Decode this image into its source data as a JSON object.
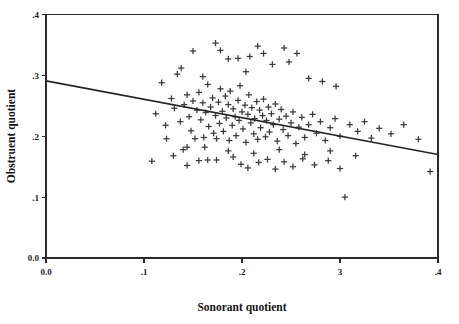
{
  "chart_data": {
    "type": "scatter",
    "title": "",
    "xlabel": "Sonorant quotient",
    "ylabel": "Obstruent quotient",
    "xlim": [
      0.0,
      0.4
    ],
    "ylim": [
      0.0,
      0.4
    ],
    "xticks": [
      0.0,
      0.1,
      0.2,
      0.3,
      0.4
    ],
    "yticks": [
      0.0,
      0.1,
      0.2,
      0.3,
      0.4
    ],
    "xticklabels": [
      "0.0",
      ".1",
      ".2",
      "3",
      ".4"
    ],
    "yticklabels": [
      "0.0",
      ".1",
      ".2",
      ".3",
      ".4"
    ],
    "grid": false,
    "legend": null,
    "marker": "plus",
    "marker_color": "#3a3a3a",
    "frame_color": "#2a2a2a",
    "series": [
      {
        "name": "observations",
        "points": [
          [
            0.108,
            0.159
          ],
          [
            0.112,
            0.237
          ],
          [
            0.118,
            0.288
          ],
          [
            0.123,
            0.196
          ],
          [
            0.128,
            0.262
          ],
          [
            0.131,
            0.246
          ],
          [
            0.134,
            0.302
          ],
          [
            0.137,
            0.224
          ],
          [
            0.14,
            0.178
          ],
          [
            0.141,
            0.252
          ],
          [
            0.144,
            0.268
          ],
          [
            0.146,
            0.232
          ],
          [
            0.148,
            0.209
          ],
          [
            0.15,
            0.258
          ],
          [
            0.152,
            0.196
          ],
          [
            0.154,
            0.243
          ],
          [
            0.156,
            0.272
          ],
          [
            0.158,
            0.227
          ],
          [
            0.16,
            0.255
          ],
          [
            0.161,
            0.198
          ],
          [
            0.163,
            0.239
          ],
          [
            0.165,
            0.285
          ],
          [
            0.166,
            0.216
          ],
          [
            0.168,
            0.248
          ],
          [
            0.17,
            0.263
          ],
          [
            0.171,
            0.205
          ],
          [
            0.173,
            0.234
          ],
          [
            0.174,
            0.196
          ],
          [
            0.176,
            0.256
          ],
          [
            0.177,
            0.221
          ],
          [
            0.178,
            0.278
          ],
          [
            0.18,
            0.241
          ],
          [
            0.181,
            0.208
          ],
          [
            0.183,
            0.266
          ],
          [
            0.184,
            0.23
          ],
          [
            0.186,
            0.252
          ],
          [
            0.187,
            0.193
          ],
          [
            0.188,
            0.274
          ],
          [
            0.19,
            0.218
          ],
          [
            0.191,
            0.245
          ],
          [
            0.193,
            0.232
          ],
          [
            0.194,
            0.201
          ],
          [
            0.196,
            0.259
          ],
          [
            0.197,
            0.226
          ],
          [
            0.198,
            0.283
          ],
          [
            0.2,
            0.24
          ],
          [
            0.201,
            0.212
          ],
          [
            0.203,
            0.251
          ],
          [
            0.204,
            0.19
          ],
          [
            0.206,
            0.236
          ],
          [
            0.207,
            0.268
          ],
          [
            0.209,
            0.222
          ],
          [
            0.21,
            0.247
          ],
          [
            0.212,
            0.204
          ],
          [
            0.213,
            0.229
          ],
          [
            0.215,
            0.257
          ],
          [
            0.216,
            0.195
          ],
          [
            0.218,
            0.243
          ],
          [
            0.219,
            0.214
          ],
          [
            0.221,
            0.234
          ],
          [
            0.222,
            0.261
          ],
          [
            0.224,
            0.199
          ],
          [
            0.225,
            0.226
          ],
          [
            0.227,
            0.248
          ],
          [
            0.228,
            0.207
          ],
          [
            0.23,
            0.237
          ],
          [
            0.232,
            0.219
          ],
          [
            0.234,
            0.253
          ],
          [
            0.236,
            0.192
          ],
          [
            0.238,
            0.228
          ],
          [
            0.24,
            0.244
          ],
          [
            0.242,
            0.211
          ],
          [
            0.245,
            0.233
          ],
          [
            0.247,
            0.201
          ],
          [
            0.25,
            0.222
          ],
          [
            0.252,
            0.24
          ],
          [
            0.255,
            0.188
          ],
          [
            0.258,
            0.215
          ],
          [
            0.261,
            0.231
          ],
          [
            0.264,
            0.198
          ],
          [
            0.268,
            0.219
          ],
          [
            0.272,
            0.236
          ],
          [
            0.276,
            0.205
          ],
          [
            0.28,
            0.224
          ],
          [
            0.285,
            0.193
          ],
          [
            0.29,
            0.214
          ],
          [
            0.295,
            0.229
          ],
          [
            0.3,
            0.2
          ],
          [
            0.305,
            0.1
          ],
          [
            0.31,
            0.219
          ],
          [
            0.318,
            0.208
          ],
          [
            0.325,
            0.224
          ],
          [
            0.332,
            0.197
          ],
          [
            0.34,
            0.213
          ],
          [
            0.352,
            0.204
          ],
          [
            0.365,
            0.219
          ],
          [
            0.38,
            0.195
          ],
          [
            0.392,
            0.142
          ],
          [
            0.15,
            0.34
          ],
          [
            0.173,
            0.353
          ],
          [
            0.178,
            0.341
          ],
          [
            0.186,
            0.327
          ],
          [
            0.196,
            0.328
          ],
          [
            0.208,
            0.331
          ],
          [
            0.216,
            0.348
          ],
          [
            0.222,
            0.336
          ],
          [
            0.231,
            0.318
          ],
          [
            0.243,
            0.345
          ],
          [
            0.248,
            0.322
          ],
          [
            0.256,
            0.336
          ],
          [
            0.138,
            0.312
          ],
          [
            0.16,
            0.298
          ],
          [
            0.204,
            0.306
          ],
          [
            0.268,
            0.295
          ],
          [
            0.282,
            0.29
          ],
          [
            0.296,
            0.282
          ],
          [
            0.13,
            0.168
          ],
          [
            0.144,
            0.152
          ],
          [
            0.156,
            0.16
          ],
          [
            0.165,
            0.161
          ],
          [
            0.174,
            0.161
          ],
          [
            0.191,
            0.166
          ],
          [
            0.199,
            0.154
          ],
          [
            0.206,
            0.148
          ],
          [
            0.217,
            0.157
          ],
          [
            0.226,
            0.162
          ],
          [
            0.234,
            0.146
          ],
          [
            0.243,
            0.158
          ],
          [
            0.252,
            0.15
          ],
          [
            0.262,
            0.163
          ],
          [
            0.274,
            0.153
          ],
          [
            0.288,
            0.16
          ],
          [
            0.3,
            0.147
          ],
          [
            0.122,
            0.218
          ],
          [
            0.186,
            0.176
          ],
          [
            0.212,
            0.172
          ],
          [
            0.238,
            0.178
          ],
          [
            0.264,
            0.17
          ],
          [
            0.29,
            0.176
          ],
          [
            0.316,
            0.168
          ],
          [
            0.162,
            0.182
          ],
          [
            0.144,
            0.182
          ]
        ]
      }
    ],
    "fit_line": {
      "name": "regression-line",
      "x0": 0.0,
      "y0": 0.291,
      "x1": 0.4,
      "y1": 0.17
    }
  },
  "axes": {
    "x_title": "Sonorant quotient",
    "y_title": "Obstruent quotient"
  }
}
